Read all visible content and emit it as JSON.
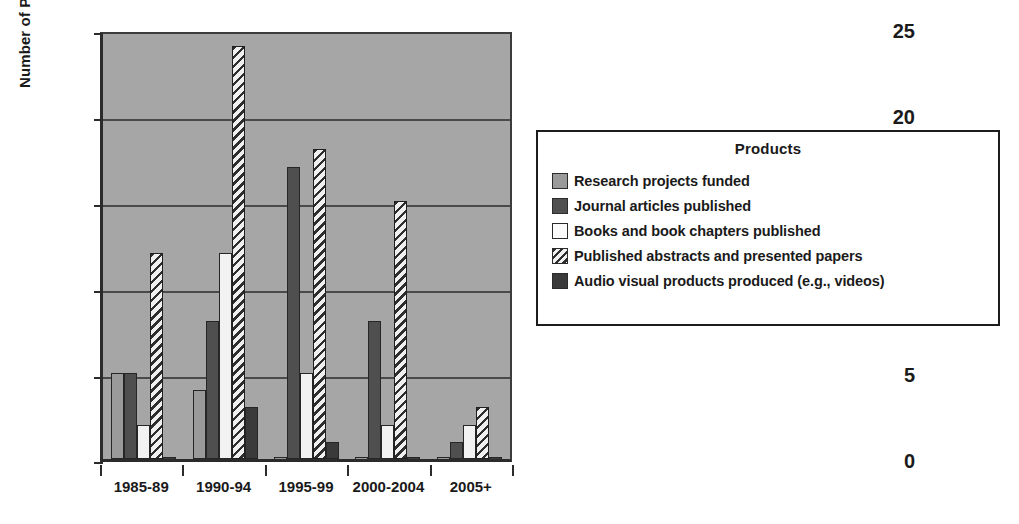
{
  "chart_data": {
    "type": "bar",
    "title": "",
    "xlabel": "",
    "ylabel": "Number of Products",
    "ylim": [
      0,
      25
    ],
    "yticks": [
      0,
      5,
      10,
      15,
      20,
      25
    ],
    "grid": true,
    "legend_position": "right",
    "legend_title": "Products",
    "categories": [
      "1985-89",
      "1990-94",
      "1995-99",
      "2000-2004",
      "2005+"
    ],
    "series": [
      {
        "name": "Research projects funded",
        "values": [
          5,
          4,
          0,
          0,
          0
        ],
        "swatch": "s1",
        "color": "#9a9a9a",
        "pattern": "solid"
      },
      {
        "name": "Journal articles published",
        "values": [
          5,
          8,
          17,
          8,
          1
        ],
        "swatch": "s2",
        "color": "#4f4f4f",
        "pattern": "solid"
      },
      {
        "name": "Books and book chapters published",
        "values": [
          2,
          12,
          5,
          2,
          2
        ],
        "swatch": "s3",
        "color": "#f2f2f2",
        "pattern": "solid"
      },
      {
        "name": "Published abstracts and presented papers",
        "values": [
          12,
          24,
          18,
          15,
          3
        ],
        "swatch": "s4",
        "color": "#e8e8e8",
        "pattern": "diagonal-hatch"
      },
      {
        "name": "Audio visual products produced (e.g., videos)",
        "values": [
          0,
          3,
          1,
          0,
          0
        ],
        "swatch": "s5",
        "color": "#3a3a3a",
        "pattern": "solid"
      }
    ],
    "plot_background": "#a6a6a6",
    "gridline_color": "#4a4a4a",
    "axis_color": "#2b2b2b"
  }
}
